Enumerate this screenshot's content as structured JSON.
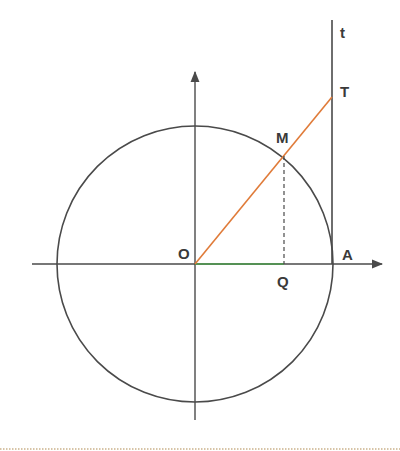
{
  "diagram": {
    "colors": {
      "stroke": "#4a4a4a",
      "radius_line": "#e07b39",
      "cos_segment": "#4a9a4a",
      "dotted_border": "#b08a50"
    },
    "labels": {
      "origin": "O",
      "point_on_circle": "M",
      "tangent_point": "T",
      "projection": "Q",
      "axis_point": "A",
      "tangent_axis": "t"
    },
    "geometry": {
      "center": [
        195,
        264
      ],
      "radius": 138,
      "M": [
        284,
        154
      ],
      "T": [
        332,
        97
      ],
      "Q": [
        284,
        264
      ],
      "A": [
        332,
        264
      ]
    }
  }
}
